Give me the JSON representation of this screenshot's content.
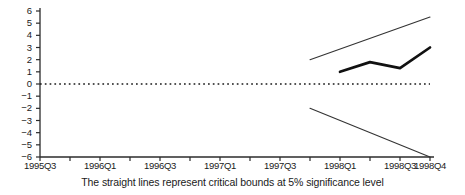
{
  "chart_data": {
    "type": "line",
    "title": "",
    "subtitle": "",
    "xlabel": "",
    "ylabel": "",
    "caption": "The straight lines represent critical bounds at 5% significance level",
    "grid": false,
    "legend": "none",
    "ylim": [
      -6,
      6
    ],
    "yticks": [
      6,
      5,
      4,
      3,
      2,
      1,
      0,
      -1,
      -2,
      -3,
      -4,
      -5,
      -6
    ],
    "ytick_labels": [
      "6",
      "5",
      "4",
      "3",
      "2",
      "1",
      "0",
      "−1",
      "−2",
      "−3",
      "−4",
      "−5",
      "−6"
    ],
    "x": [
      "1995Q3",
      "1995Q4",
      "1996Q1",
      "1996Q2",
      "1996Q3",
      "1996Q4",
      "1997Q1",
      "1997Q2",
      "1997Q3",
      "1997Q4",
      "1998Q1",
      "1998Q2",
      "1998Q3",
      "1998Q4"
    ],
    "xtick_labels": [
      "1995Q3",
      "1996Q1",
      "1996Q3",
      "1997Q1",
      "1997Q3",
      "1998Q1",
      "1998Q3",
      "1998Q4"
    ],
    "xtick_positions": [
      "1995Q3",
      "1996Q1",
      "1996Q3",
      "1997Q1",
      "1997Q3",
      "1998Q1",
      "1998Q3",
      "1998Q4"
    ],
    "zero_line": 0,
    "series": [
      {
        "name": "upper-critical-bound",
        "style": "thin",
        "color": "#333333",
        "points": [
          {
            "x": "1997Q4",
            "y": 2.0
          },
          {
            "x": "1998Q4",
            "y": 5.5
          }
        ]
      },
      {
        "name": "lower-critical-bound",
        "style": "thin",
        "color": "#333333",
        "points": [
          {
            "x": "1997Q4",
            "y": -2.0
          },
          {
            "x": "1998Q4",
            "y": -6.0
          }
        ]
      },
      {
        "name": "cusum-statistic",
        "style": "thick",
        "color": "#111111",
        "points": [
          {
            "x": "1998Q1",
            "y": 1.0
          },
          {
            "x": "1998Q2",
            "y": 1.8
          },
          {
            "x": "1998Q3",
            "y": 1.3
          },
          {
            "x": "1998Q4",
            "y": 3.0
          }
        ]
      }
    ]
  }
}
